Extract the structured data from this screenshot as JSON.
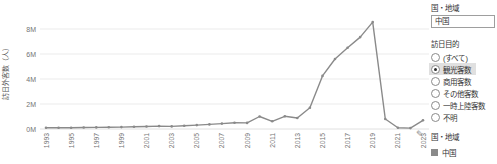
{
  "chart_data": {
    "type": "line",
    "title": "",
    "ylabel": "訪日外客数（人）",
    "xlabel": "",
    "x": [
      1993,
      1994,
      1995,
      1996,
      1997,
      1998,
      1999,
      2000,
      2001,
      2002,
      2003,
      2004,
      2005,
      2006,
      2007,
      2008,
      2009,
      2010,
      2011,
      2012,
      2013,
      2014,
      2015,
      2016,
      2017,
      2018,
      2019,
      2020,
      2021,
      2022,
      2023
    ],
    "series": [
      {
        "name": "中国",
        "color": "#8a8a8a",
        "values": [
          0.1,
          0.1,
          0.1,
          0.12,
          0.13,
          0.14,
          0.15,
          0.18,
          0.2,
          0.23,
          0.21,
          0.26,
          0.31,
          0.37,
          0.43,
          0.5,
          0.49,
          1.0,
          0.62,
          1.02,
          0.88,
          1.7,
          4.25,
          5.6,
          6.5,
          7.35,
          8.55,
          0.8,
          0.1,
          0.07,
          0.7
        ]
      }
    ],
    "ylim": [
      0,
      9
    ],
    "yticks": [
      {
        "value": 0,
        "label": "0M"
      },
      {
        "value": 2,
        "label": "2M"
      },
      {
        "value": 4,
        "label": "4M"
      },
      {
        "value": 6,
        "label": "6M"
      },
      {
        "value": 8,
        "label": "8M"
      }
    ],
    "xtick_labels": [
      "1993",
      "1995",
      "1997",
      "1999",
      "2001",
      "2003",
      "2005",
      "2007",
      "2009",
      "2011",
      "2013",
      "2015",
      "2017",
      "2019",
      "2021",
      "2023"
    ],
    "grid": "horizontal",
    "grid_color": "#ebebeb",
    "tick_text_color": "#737373",
    "legend_position": "right-bottom"
  },
  "filters": {
    "country_label": "国・地域",
    "country_value": "中国",
    "purpose_label": "訪日目的",
    "purpose_options": [
      {
        "label": "(すべて)",
        "selected": false
      },
      {
        "label": "観光客数",
        "selected": true
      },
      {
        "label": "商用客数",
        "selected": false
      },
      {
        "label": "その他客数",
        "selected": false
      },
      {
        "label": "一時上陸客数",
        "selected": false
      },
      {
        "label": "不明",
        "selected": false
      }
    ]
  },
  "legend": {
    "title": "国・地域",
    "items": [
      {
        "label": "中国",
        "color": "#8a8a8a"
      }
    ]
  },
  "icons": {
    "pencil": "✎"
  }
}
